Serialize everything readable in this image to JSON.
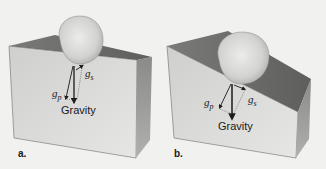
{
  "figure": {
    "panels": [
      {
        "id": "a",
        "label": "a.",
        "description": "Boulder on gentle slope",
        "vectors": {
          "gravity": "Gravity",
          "g_p": {
            "symbol": "g",
            "subscript": "p"
          },
          "g_s": {
            "symbol": "g",
            "subscript": "s"
          }
        }
      },
      {
        "id": "b",
        "label": "b.",
        "description": "Boulder on steep slope",
        "vectors": {
          "gravity": "Gravity",
          "g_p": {
            "symbol": "g",
            "subscript": "p"
          },
          "g_s": {
            "symbol": "g",
            "subscript": "s"
          }
        }
      }
    ],
    "colors": {
      "background": "#f1f1f0",
      "top_face": "#6e6e6e",
      "front_face": "#d8d8d6",
      "side_face": "#9a9a98",
      "boulder": "#dcdcda",
      "arrow": "#1a1a1a"
    }
  }
}
